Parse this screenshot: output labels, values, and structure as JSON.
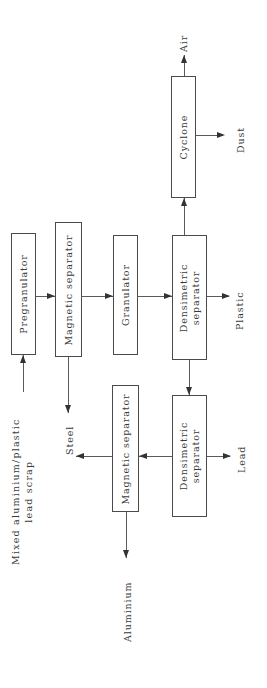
{
  "diagram": {
    "orientation": "rotated-90-ccw",
    "line_color": "#5a5a5a",
    "box_border_color": "#4a4a4a",
    "text_color": "#3a3a3a",
    "background": "#ffffff",
    "nodes": [
      {
        "id": "pregranulator",
        "label": "Pregranulator"
      },
      {
        "id": "magnetic-separator-1",
        "label": "Magnetic  separator"
      },
      {
        "id": "granulator",
        "label": "Granulator"
      },
      {
        "id": "densimetric-separator-1",
        "label": "Densimetric\nseparator"
      },
      {
        "id": "cyclone",
        "label": "Cyclone"
      },
      {
        "id": "densimetric-separator-2",
        "label": "Densimetric\nseparator"
      },
      {
        "id": "magnetic-separator-2",
        "label": "Magnetic  separator"
      }
    ],
    "streams": [
      {
        "id": "feed",
        "label": "Mixed  aluminium/plastic\nlead  scrap"
      },
      {
        "id": "steel",
        "label": "Steel"
      },
      {
        "id": "aluminium",
        "label": "Aluminium"
      },
      {
        "id": "plastic",
        "label": "Plastic"
      },
      {
        "id": "lead",
        "label": "Lead"
      },
      {
        "id": "air",
        "label": "Air"
      },
      {
        "id": "dust",
        "label": "Dust"
      }
    ]
  }
}
